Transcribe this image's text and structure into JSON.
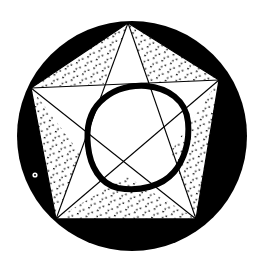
{
  "figure": {
    "type": "geometric-illustration",
    "colors": {
      "background": "#ffffff",
      "disk": "#000000",
      "fill": "#ffffff",
      "stipple": "#111111",
      "lines": "#000000"
    },
    "disk": {
      "cx": 132,
      "cy": 136,
      "r": 115
    },
    "pentagon": [
      [
        128,
        23
      ],
      [
        219,
        80
      ],
      [
        196,
        219
      ],
      [
        56,
        219
      ],
      [
        31,
        88
      ]
    ],
    "marker_dot": {
      "cx": 35,
      "cy": 175
    }
  }
}
